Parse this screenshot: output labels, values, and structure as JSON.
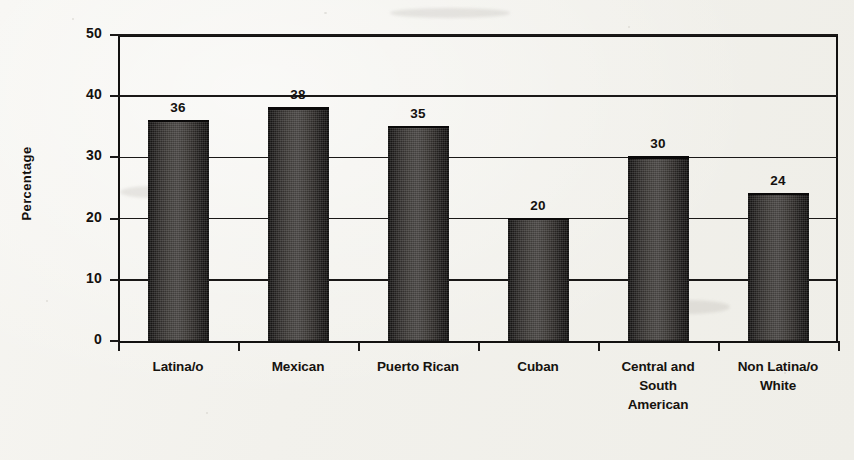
{
  "chart_data": {
    "type": "bar",
    "title": "",
    "xlabel": "",
    "ylabel": "Percentage",
    "ylim": [
      0,
      50
    ],
    "ytick_values": [
      0,
      10,
      20,
      30,
      40,
      50
    ],
    "ytick_labels": [
      "0",
      "10",
      "20",
      "30",
      "40",
      "50"
    ],
    "grid": true,
    "legend": "none",
    "categories": [
      "Latina/o",
      "Mexican",
      "Puerto Rican",
      "Cuban",
      "Central and South American",
      "Non Latina/o White"
    ],
    "category_lines": [
      [
        "Latina/o"
      ],
      [
        "Mexican"
      ],
      [
        "Puerto Rican"
      ],
      [
        "Cuban"
      ],
      [
        "Central and",
        "South",
        "American"
      ],
      [
        "Non Latina/o",
        "White"
      ]
    ],
    "values": [
      36,
      38,
      35,
      20,
      30,
      24
    ],
    "value_labels": [
      "36",
      "38",
      "35",
      "20",
      "30",
      "24"
    ],
    "colors": {
      "bar_dark": "#0d0c0b",
      "bar_light": "#454240",
      "axis": "#121110",
      "text": "#14110f",
      "background": "#f4f3ef"
    }
  }
}
